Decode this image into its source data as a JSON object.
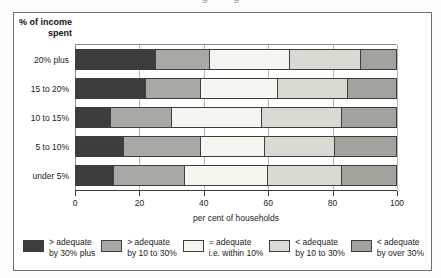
{
  "page": {
    "top_cropped_text": "g g"
  },
  "chart_data": {
    "type": "bar",
    "stacked": true,
    "orientation": "horizontal",
    "title": "% of income spent",
    "title_lines": {
      "line1": "% of income",
      "line2": "spent"
    },
    "categories": [
      "20% plus",
      "15 to 20%",
      "10 to 15%",
      "5 to 10%",
      "under 5%"
    ],
    "series": [
      {
        "name": "> adequate by 30% plus",
        "color": "#3d3d3d",
        "values": [
          25,
          22,
          11,
          15,
          12
        ]
      },
      {
        "name": "> adequate by 10 to 30%",
        "color": "#a8a8a5",
        "values": [
          17,
          17,
          19,
          24,
          22
        ]
      },
      {
        "name": "= adequate i.e. within 10%",
        "color": "#f6f6f0",
        "values": [
          25,
          24,
          28,
          20,
          26
        ]
      },
      {
        "name": "< adequate by 10 to 30%",
        "color": "#dadad2",
        "values": [
          22,
          22,
          25,
          22,
          23
        ]
      },
      {
        "name": "< adequate by over 30%",
        "color": "#a3a39e",
        "values": [
          11,
          15,
          17,
          19,
          17
        ]
      }
    ],
    "legend": [
      {
        "line1": "> adequate",
        "line2": "by 30% plus"
      },
      {
        "line1": "> adequate",
        "line2": "by 10 to 30%"
      },
      {
        "line1": "= adequate",
        "line2": "i.e. within 10%"
      },
      {
        "line1": "< adequate",
        "line2": "by 10 to 30%"
      },
      {
        "line1": "< adequate",
        "line2": "by over 30%"
      }
    ],
    "xlabel": "per cent of households",
    "xlim": [
      0,
      100
    ],
    "xticks": [
      0,
      20,
      40,
      60,
      80,
      100
    ],
    "grid": "vertical",
    "legend_position": "bottom",
    "colors": {
      "figure_border": "#6f6f6f",
      "axis": "#3a3a3a",
      "gridline": "#b6b6b2",
      "bar_border": "#3e3e3e"
    }
  }
}
